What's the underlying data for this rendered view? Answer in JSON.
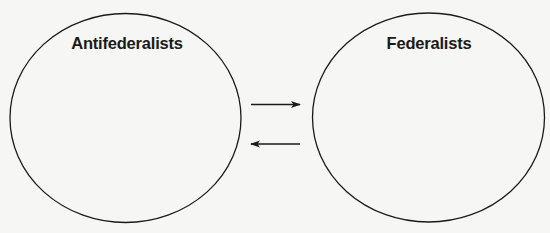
{
  "diagram": {
    "left_circle": {
      "label": "Antifederalists",
      "cx": 125.5,
      "cy": 118,
      "rx": 115.5,
      "ry": 104.5
    },
    "right_circle": {
      "label": "Federalists",
      "cx": 428.5,
      "cy": 117.5,
      "rx": 116,
      "ry": 104.5
    },
    "arrows": [
      {
        "direction": "right",
        "x1": 251,
        "x2": 300,
        "y": 104.5
      },
      {
        "direction": "left",
        "x1": 251,
        "x2": 300,
        "y": 144
      }
    ],
    "colors": {
      "stroke": "#1a1a1a",
      "background": "#f6f6f5"
    }
  }
}
